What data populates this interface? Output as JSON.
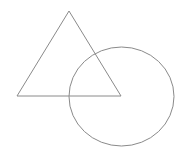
{
  "diagram": {
    "width": 189,
    "height": 156,
    "stroke_color": "#8a8a8a",
    "shapes": [
      {
        "type": "triangle",
        "points": "69,11 17,96 121,96"
      },
      {
        "type": "circle",
        "cx": 121.5,
        "cy": 96.5,
        "r": 51
      }
    ]
  }
}
